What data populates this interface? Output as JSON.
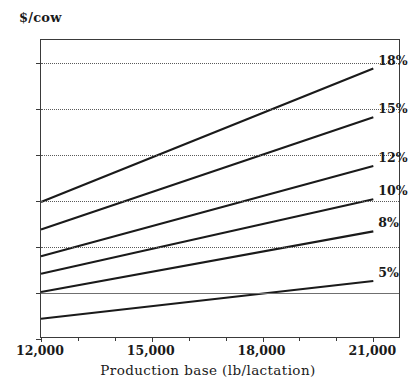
{
  "chart_data": {
    "type": "line",
    "title": "",
    "xlabel": "Production base (lb/lactation)",
    "ylabel": "$/cow",
    "x": [
      12000,
      21000
    ],
    "xlim": [
      12000,
      21750
    ],
    "ylim": [
      -50,
      275
    ],
    "xticks": [
      12000,
      15000,
      18000,
      21000
    ],
    "xticklabels": [
      "12,000",
      "15,000",
      "18,000",
      "21,000"
    ],
    "yticks": [
      -50,
      0,
      50,
      100,
      150,
      200,
      250
    ],
    "yticklabels": [
      "-50",
      "0",
      "50",
      "100",
      "150",
      "200",
      "250"
    ],
    "grid": "horizontal-dotted-at-50-100-150-200-250",
    "legend_position": "right-of-line-ends",
    "series": [
      {
        "name": "18%",
        "label": "18%",
        "values": [
          99,
          244
        ]
      },
      {
        "name": "15%",
        "label": "15%",
        "values": [
          69,
          191
        ]
      },
      {
        "name": "12%",
        "label": "12%",
        "values": [
          40,
          138
        ]
      },
      {
        "name": "10%",
        "label": "10%",
        "values": [
          21,
          102
        ]
      },
      {
        "name": "8%",
        "label": "8%",
        "values": [
          1,
          67
        ]
      },
      {
        "name": "5%",
        "label": "5%",
        "values": [
          -28,
          13
        ]
      }
    ]
  },
  "axes": {
    "y_axis_title": "$/cow",
    "x_axis_title": "Production base (lb/lactation)"
  },
  "colors": {
    "line": "#1a1a1a",
    "axis": "#3a3a3a",
    "grid": "#5a5a5a",
    "zero": "#6f6f6f",
    "background": "#ffffff"
  }
}
